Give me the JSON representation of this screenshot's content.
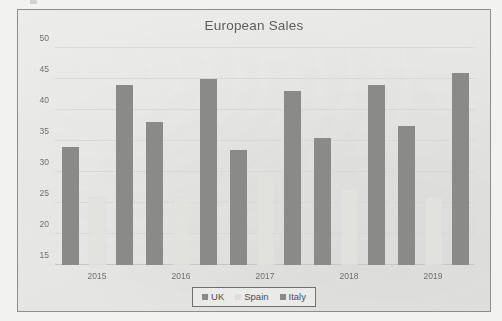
{
  "chart_data": {
    "type": "bar",
    "title": "European Sales",
    "xlabel": "",
    "ylabel": "",
    "categories": [
      "2015",
      "2016",
      "2017",
      "2018",
      "2019"
    ],
    "series": [
      {
        "name": "UK",
        "color": "#8a8a88",
        "values": [
          34,
          38,
          33.5,
          35.5,
          37.5
        ]
      },
      {
        "name": "Spain",
        "color": "#dededa",
        "values": [
          26,
          26,
          29.5,
          27.5,
          26
        ]
      },
      {
        "name": "Italy",
        "color": "#8a8a88",
        "values": [
          44,
          45,
          43,
          44,
          46
        ]
      }
    ],
    "ylim": [
      15,
      50
    ],
    "yticks": [
      15,
      20,
      25,
      30,
      35,
      40,
      45,
      50
    ],
    "ytick_labels": [
      "15",
      "20",
      "25",
      "30",
      "35",
      "40",
      "45",
      "50"
    ],
    "grid": true,
    "legend_position": "bottom"
  },
  "legend": {
    "items": [
      {
        "label": "UK"
      },
      {
        "label": "Spain"
      },
      {
        "label": "Italy"
      }
    ]
  }
}
